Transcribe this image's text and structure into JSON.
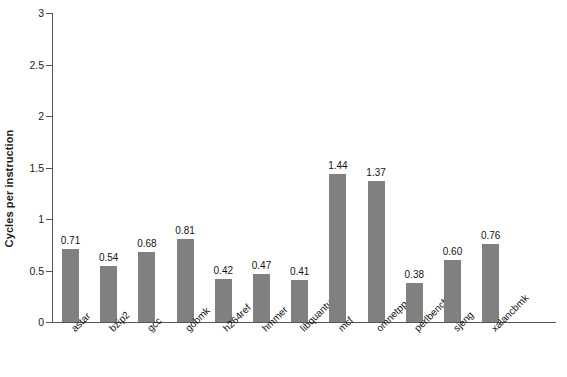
{
  "chart_data": {
    "type": "bar",
    "title": "",
    "xlabel": "",
    "ylabel": "Cycles per instruction",
    "ylim": [
      0,
      3
    ],
    "yticks": [
      "0",
      "0.5",
      "1",
      "1.5",
      "2",
      "2.5",
      "3"
    ],
    "ytick_values": [
      0,
      0.5,
      1,
      1.5,
      2,
      2.5,
      3
    ],
    "grid": false,
    "legend": null,
    "bar_color": "#808080",
    "axis_color": "#555555",
    "background": "#ffffff",
    "categories": [
      "astar",
      "bzip2",
      "gcc",
      "gobmk",
      "h264ref",
      "hmmer",
      "libquantum",
      "mcf",
      "omnetpp",
      "perlbench",
      "sjeng",
      "xalancbmk"
    ],
    "values": [
      0.71,
      0.54,
      0.68,
      0.81,
      0.42,
      0.47,
      0.41,
      1.44,
      1.37,
      0.38,
      0.6,
      0.76
    ],
    "value_labels": [
      "0.71",
      "0.54",
      "0.68",
      "0.81",
      "0.42",
      "0.47",
      "0.41",
      "1.44",
      "1.37",
      "0.38",
      "0.60",
      "0.76"
    ]
  }
}
